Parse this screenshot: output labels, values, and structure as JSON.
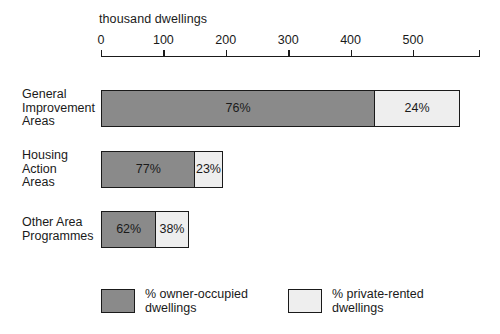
{
  "chart_data": {
    "type": "bar",
    "orientation": "horizontal",
    "stacked": true,
    "stack_unit": "percent",
    "title": "",
    "xlabel": "thousand dwellings",
    "ylabel": "",
    "xlim": [
      0,
      608
    ],
    "axis_ticks": [
      0,
      100,
      200,
      300,
      400,
      500
    ],
    "axis_tick_labels": [
      "0",
      "100",
      "200",
      "300",
      "400",
      "500"
    ],
    "grid": false,
    "legend_position": "bottom",
    "categories": [
      "General Improvement Areas",
      "Housing Action Areas",
      "Other Area Programmes"
    ],
    "series": [
      {
        "name": "% owner-occupied dwellings",
        "color": "#8a8a8a",
        "values": [
          76,
          77,
          62
        ],
        "labels": [
          "76%",
          "77%",
          "62%"
        ]
      },
      {
        "name": "% private-rented dwellings",
        "color": "#eeeeee",
        "values": [
          24,
          23,
          38
        ],
        "labels": [
          "24%",
          "23%",
          "38%"
        ]
      }
    ],
    "totals_thousand_dwellings": [
      578,
      197,
      143
    ]
  },
  "axis": {
    "title": "thousand dwellings",
    "ticks": [
      {
        "label": "0",
        "value": 0
      },
      {
        "label": "100",
        "value": 100
      },
      {
        "label": "200",
        "value": 200
      },
      {
        "label": "300",
        "value": 300
      },
      {
        "label": "400",
        "value": 400
      },
      {
        "label": "500",
        "value": 500
      }
    ]
  },
  "rows": [
    {
      "label_lines": [
        "General",
        "Improvement",
        "Areas"
      ],
      "label": "General Improvement Areas",
      "total": 578,
      "segments": [
        {
          "kind": "dark",
          "label": "76%",
          "percent": 76
        },
        {
          "kind": "light",
          "label": "24%",
          "percent": 24
        }
      ]
    },
    {
      "label_lines": [
        "Housing",
        "Action",
        "Areas"
      ],
      "label": "Housing Action Areas",
      "total": 197,
      "segments": [
        {
          "kind": "dark",
          "label": "77%",
          "percent": 77
        },
        {
          "kind": "light",
          "label": "23%",
          "percent": 23
        }
      ]
    },
    {
      "label_lines": [
        "Other Area",
        "Programmes"
      ],
      "label": "Other Area Programmes",
      "total": 143,
      "segments": [
        {
          "kind": "dark",
          "label": "62%",
          "percent": 62
        },
        {
          "kind": "light",
          "label": "38%",
          "percent": 38
        }
      ]
    }
  ],
  "legend": [
    {
      "kind": "dark",
      "lines": [
        "% owner-occupied",
        "dwellings"
      ],
      "text": "% owner-occupied dwellings",
      "color": "#8a8a8a"
    },
    {
      "kind": "light",
      "lines": [
        "% private-rented",
        "dwellings"
      ],
      "text": "% private-rented dwellings",
      "color": "#eeeeee"
    }
  ],
  "colors": {
    "owner_occupied": "#8a8a8a",
    "private_rented": "#eeeeee",
    "outline": "#1a1a1a",
    "background": "#ffffff"
  }
}
